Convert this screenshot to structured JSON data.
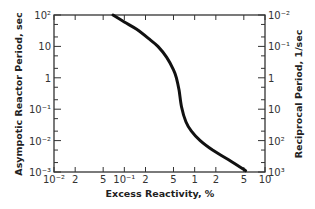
{
  "chart_data": {
    "type": "line",
    "title": "",
    "xlabel": "Excess Reactivity, %",
    "ylabel": "Asympotic Reactor Period, sec",
    "y2label": "Reciprocal Period, 1/sec",
    "xscale": "log",
    "yscale": "log",
    "xlim": [
      0.01,
      10
    ],
    "ylim": [
      0.001,
      100
    ],
    "grid": false,
    "legend": null,
    "x_ticks": [
      {
        "value": 0.01,
        "label": "10⁻²"
      },
      {
        "value": 0.02,
        "label": "2"
      },
      {
        "value": 0.05,
        "label": "5"
      },
      {
        "value": 0.1,
        "label": "10⁻¹"
      },
      {
        "value": 0.2,
        "label": "2"
      },
      {
        "value": 0.5,
        "label": "5"
      },
      {
        "value": 1,
        "label": "1"
      },
      {
        "value": 2,
        "label": "2"
      },
      {
        "value": 5,
        "label": "5"
      },
      {
        "value": 10,
        "label": "10"
      }
    ],
    "y_ticks": [
      {
        "value": 100,
        "label": "10²"
      },
      {
        "value": 10,
        "label": "10"
      },
      {
        "value": 1,
        "label": "1"
      },
      {
        "value": 0.1,
        "label": "10⁻¹"
      },
      {
        "value": 0.01,
        "label": "10⁻²"
      },
      {
        "value": 0.001,
        "label": "10⁻³"
      }
    ],
    "y2_ticks": [
      {
        "value": 100,
        "label": "10⁻²"
      },
      {
        "value": 10,
        "label": "10⁻¹"
      },
      {
        "value": 1,
        "label": "1"
      },
      {
        "value": 0.1,
        "label": "10"
      },
      {
        "value": 0.01,
        "label": "10²"
      },
      {
        "value": 0.001,
        "label": "10³"
      }
    ],
    "series": [
      {
        "name": "Asymptotic period vs excess reactivity",
        "x": [
          0.069,
          0.1,
          0.15,
          0.22,
          0.3,
          0.4,
          0.5,
          0.55,
          0.6,
          0.65,
          0.75,
          0.9,
          1.2,
          1.8,
          3.0,
          5.3
        ],
        "y": [
          100,
          60,
          35,
          18,
          10,
          4.5,
          1.8,
          1.0,
          0.4,
          0.12,
          0.04,
          0.02,
          0.01,
          0.005,
          0.0025,
          0.0011
        ]
      }
    ]
  }
}
